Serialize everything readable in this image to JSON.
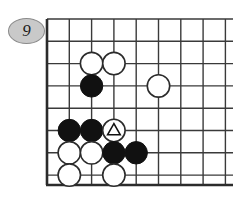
{
  "figure": {
    "caption_badge": "9",
    "badge_shape": "ellipse",
    "badge_fill_color": "#c9c9c9",
    "badge_border_color": "#8a8a8a",
    "background_color": "#ffffff",
    "line_color": "#3a3a3a",
    "border_color": "#2b2b2b",
    "black_stone_color": "#111111",
    "white_stone_color": "#ffffff",
    "white_stone_outline": "#2b2b2b",
    "marker_color": "#111111"
  },
  "board": {
    "origin_x": 47,
    "origin_y": 19,
    "spacing": 22.3,
    "columns": 9,
    "rows": 8,
    "stone_radius": 11.2,
    "grid_x": [
      47,
      69.3,
      91.6,
      113.9,
      136.2,
      158.5,
      180.8,
      203.1,
      225.4
    ],
    "grid_y": [
      19,
      41.3,
      63.6,
      85.9,
      108.2,
      130.5,
      152.8,
      175.1
    ],
    "edge_left": 47,
    "edge_bottom": 185,
    "edge_top": 19
  },
  "chart_data": {
    "type": "scatter",
    "xlabel": "board column",
    "ylabel": "board row",
    "series": [
      {
        "name": "white",
        "values": [
          {
            "col": 2,
            "row": 1,
            "label": "white"
          },
          {
            "col": 3,
            "row": 1,
            "label": "white"
          },
          {
            "col": 5,
            "row": 2,
            "label": "white"
          },
          {
            "col": 3,
            "row": 4,
            "label": "white-marked-triangle"
          },
          {
            "col": 1,
            "row": 5,
            "label": "white"
          },
          {
            "col": 2,
            "row": 5,
            "label": "white"
          },
          {
            "col": 1,
            "row": 6,
            "label": "white"
          },
          {
            "col": 3,
            "row": 6,
            "label": "white"
          }
        ]
      },
      {
        "name": "black",
        "values": [
          {
            "col": 2,
            "row": 2,
            "label": "black"
          },
          {
            "col": 1,
            "row": 4,
            "label": "black"
          },
          {
            "col": 2,
            "row": 4,
            "label": "black"
          },
          {
            "col": 3,
            "row": 5,
            "label": "black"
          },
          {
            "col": 4,
            "row": 5,
            "label": "black"
          }
        ]
      }
    ],
    "annotations": [
      {
        "type": "triangle-marker",
        "col": 3,
        "row": 4,
        "on": "white-stone"
      },
      {
        "type": "move-number-badge",
        "text": "9",
        "position": "top-left-outside-board"
      }
    ]
  },
  "stones": [
    {
      "id": "w1",
      "color": "white",
      "cx": 91.6,
      "cy": 63.6,
      "marked": false
    },
    {
      "id": "w2",
      "color": "white",
      "cx": 113.9,
      "cy": 63.6,
      "marked": false
    },
    {
      "id": "b1",
      "color": "black",
      "cx": 91.6,
      "cy": 85.9,
      "marked": false
    },
    {
      "id": "w3",
      "color": "white",
      "cx": 158.5,
      "cy": 85.9,
      "marked": false
    },
    {
      "id": "b2",
      "color": "black",
      "cx": 69.3,
      "cy": 130.5,
      "marked": false
    },
    {
      "id": "b3",
      "color": "black",
      "cx": 91.6,
      "cy": 130.5,
      "marked": false
    },
    {
      "id": "w4",
      "color": "white",
      "cx": 113.9,
      "cy": 130.5,
      "marked": true
    },
    {
      "id": "w5",
      "color": "white",
      "cx": 69.3,
      "cy": 152.8,
      "marked": false
    },
    {
      "id": "w6",
      "color": "white",
      "cx": 91.6,
      "cy": 152.8,
      "marked": false
    },
    {
      "id": "b4",
      "color": "black",
      "cx": 113.9,
      "cy": 152.8,
      "marked": false
    },
    {
      "id": "b5",
      "color": "black",
      "cx": 136.2,
      "cy": 152.8,
      "marked": false
    },
    {
      "id": "w7",
      "color": "white",
      "cx": 69.3,
      "cy": 175.1,
      "marked": false
    },
    {
      "id": "w8",
      "color": "white",
      "cx": 113.9,
      "cy": 175.1,
      "marked": false
    }
  ]
}
